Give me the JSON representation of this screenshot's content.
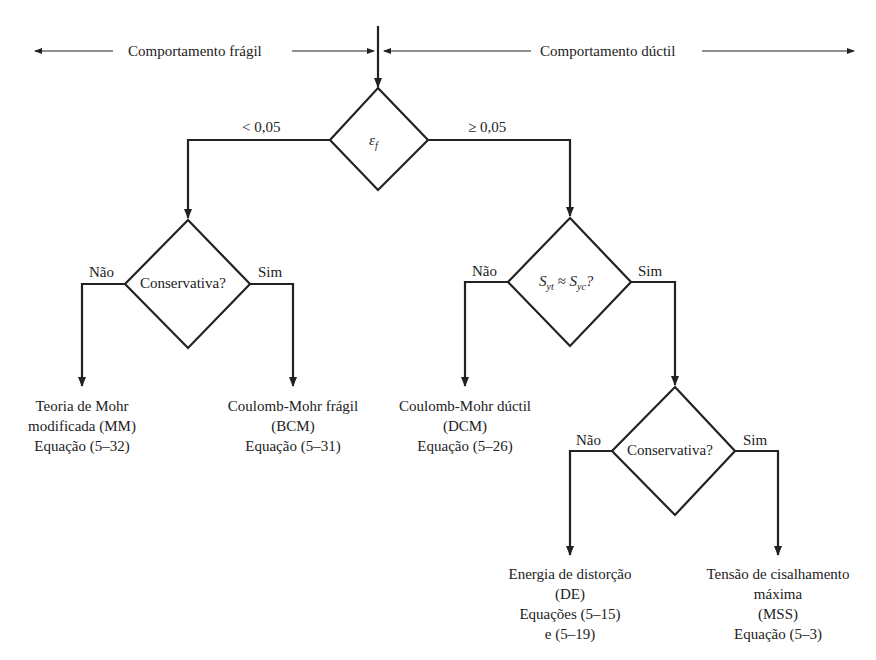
{
  "header": {
    "left_label": "Comportamento frágil",
    "right_label": "Comportamento dúctil"
  },
  "decisions": {
    "strain": {
      "symbol": "ε",
      "subscript": "f",
      "left_branch": "< 0,05",
      "right_branch": "≥ 0,05"
    },
    "brittle_conservative": {
      "question": "Conservativa?",
      "no": "Não",
      "yes": "Sim"
    },
    "strength_equal": {
      "S1": "S",
      "s1": "yt",
      "approx": " ≈ ",
      "S2": "S",
      "s2": "yc",
      "q": "?",
      "no": "Não",
      "yes": "Sim"
    },
    "ductile_conservative": {
      "question": "Conservativa?",
      "no": "Não",
      "yes": "Sim"
    }
  },
  "outcomes": {
    "mm": {
      "line1": "Teoria de Mohr",
      "line2": "modificada (MM)",
      "line3": "Equação (5–32)"
    },
    "bcm": {
      "line1": "Coulomb-Mohr frágil",
      "line2": "(BCM)",
      "line3": "Equação (5–31)"
    },
    "dcm": {
      "line1": "Coulomb-Mohr dúctil",
      "line2": "(DCM)",
      "line3": "Equação (5–26)"
    },
    "de": {
      "line1": "Energia de distorção",
      "line2": "(DE)",
      "line3": "Equações (5–15)",
      "line4": "e (5–19)"
    },
    "mss": {
      "line1": "Tensão de cisalhamento",
      "line2": "máxima",
      "line3": "(MSS)",
      "line4": "Equação (5–3)"
    }
  }
}
